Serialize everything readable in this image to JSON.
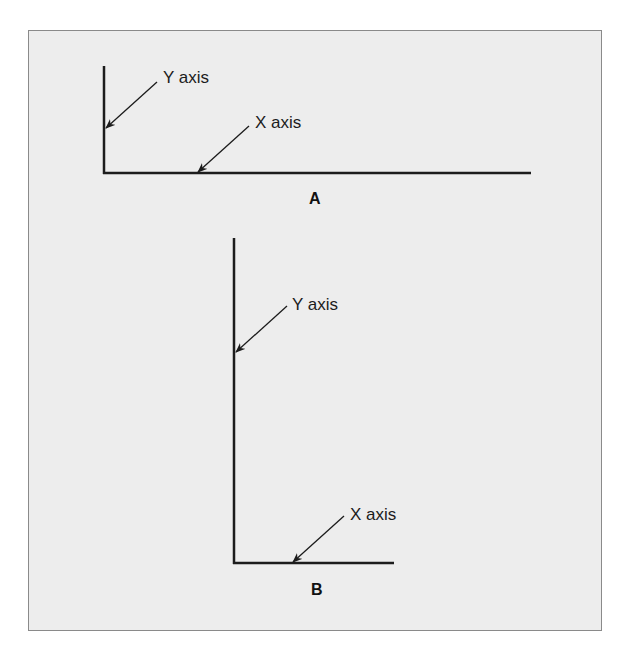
{
  "figure": {
    "panel_a": {
      "label": "A",
      "y_axis_label": "Y axis",
      "x_axis_label": "X axis",
      "description": "wide, short axes"
    },
    "panel_b": {
      "label": "B",
      "y_axis_label": "Y axis",
      "x_axis_label": "X axis",
      "description": "tall, narrow axes"
    },
    "colors": {
      "background": "#ededed",
      "border": "#8a8a8a",
      "line": "#1c1c1c"
    }
  }
}
